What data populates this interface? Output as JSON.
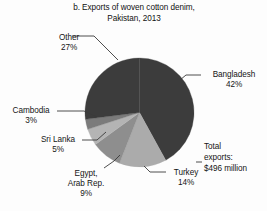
{
  "chart_data": {
    "type": "pie",
    "title": "b. Exports of woven cotton denim, Pakistan, 2013",
    "title_lines": [
      "b. Exports of woven cotton denim,",
      "Pakistan, 2013"
    ],
    "xlabel": "",
    "ylabel": "",
    "grid": false,
    "legend_position": "none",
    "annotation_lines": [
      "Total",
      "exports:",
      "$496 million"
    ],
    "annotation": "Total exports: $496 million",
    "units": "percent of total exports",
    "categories": [
      "Bangladesh",
      "Turkey",
      "Egypt, Arab Rep.",
      "Sri Lanka",
      "Cambodia",
      "Other"
    ],
    "values": [
      42,
      14,
      9,
      5,
      3,
      27
    ],
    "labels": [
      {
        "name": "Bangladesh",
        "name_lines": [
          "Bangladesh"
        ],
        "value": 42,
        "value_text": "42%",
        "color": "#3c3c3c"
      },
      {
        "name": "Turkey",
        "name_lines": [
          "Turkey"
        ],
        "value": 14,
        "value_text": "14%",
        "color": "#ababab"
      },
      {
        "name": "Egypt, Arab Rep.",
        "name_lines": [
          "Egypt,",
          "Arab Rep."
        ],
        "value": 9,
        "value_text": "9%",
        "color": "#8e8e8e"
      },
      {
        "name": "Sri Lanka",
        "name_lines": [
          "Sri Lanka"
        ],
        "value": 5,
        "value_text": "5%",
        "color": "#b4b4b4"
      },
      {
        "name": "Cambodia",
        "name_lines": [
          "Cambodia"
        ],
        "value": 3,
        "value_text": "3%",
        "color": "#7b7b7b"
      },
      {
        "name": "Other",
        "name_lines": [
          "Other"
        ],
        "value": 27,
        "value_text": "27%",
        "color": "#3c3c3c"
      }
    ],
    "total": 100
  },
  "title": {
    "line1": "b. Exports of woven cotton denim,",
    "line2": "Pakistan, 2013"
  },
  "labels": {
    "other": {
      "name": "Other",
      "value": "27%"
    },
    "bangladesh": {
      "name": "Bangladesh",
      "value": "42%"
    },
    "cambodia": {
      "name": "Cambodia",
      "value": "3%"
    },
    "srilanka": {
      "name": "Sri Lanka",
      "value": "5%"
    },
    "egypt": {
      "name": "Egypt,",
      "name2": "Arab Rep.",
      "value": "9%"
    },
    "turkey": {
      "name": "Turkey",
      "value": "14%"
    }
  },
  "total_exports": {
    "line1": "Total",
    "line2": "exports:",
    "line3": "$496 million"
  },
  "colors": {
    "dark_slice": "#3c3c3c",
    "turkey_slice": "#ababab",
    "egypt_slice": "#8e8e8e",
    "srilanka_slice": "#b4b4b4",
    "cambodia_slice": "#7b7b7b",
    "text": "#151515",
    "leader_line": "#3a3a3a",
    "background": "#fdfdfd"
  }
}
